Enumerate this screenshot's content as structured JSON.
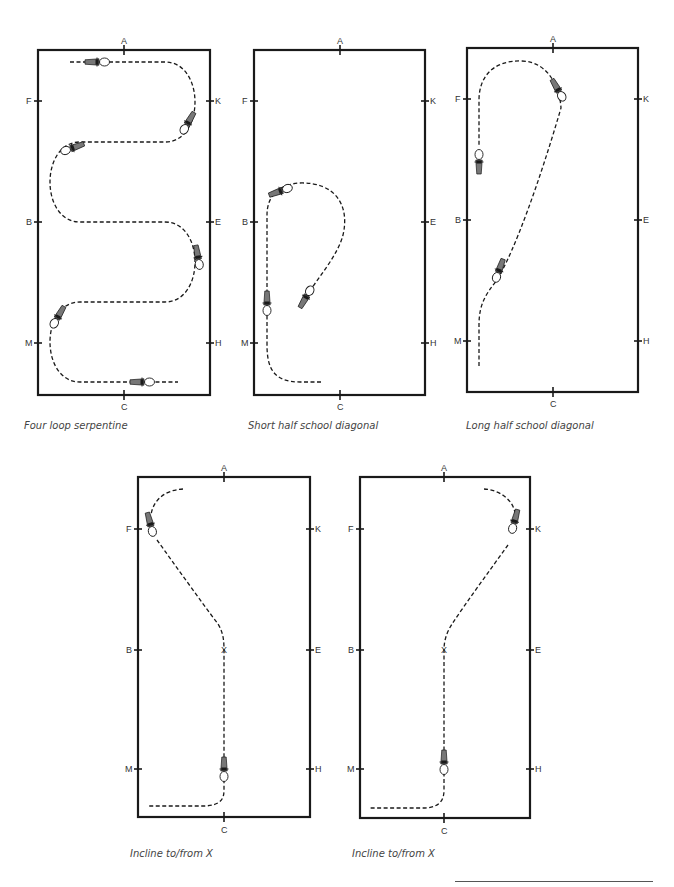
{
  "diagrams": [
    {
      "id": "four-loop-serpentine",
      "caption": "Four loop serpentine",
      "markers": {
        "top": "A",
        "bottom": "C",
        "left": [
          "F",
          "B",
          "M"
        ],
        "right": [
          "K",
          "E",
          "H"
        ]
      }
    },
    {
      "id": "short-half-school-diagonal",
      "caption": "Short half school diagonal",
      "markers": {
        "top": "A",
        "bottom": "C",
        "left": [
          "F",
          "B",
          "M"
        ],
        "right": [
          "K",
          "E",
          "H"
        ]
      }
    },
    {
      "id": "long-half-school-diagonal",
      "caption": "Long half school diagonal",
      "markers": {
        "top": "A",
        "bottom": "C",
        "left": [
          "F",
          "B",
          "M"
        ],
        "right": [
          "K",
          "E",
          "H"
        ]
      }
    },
    {
      "id": "incline-to-from-x-left",
      "caption": "Incline to/from X",
      "markers": {
        "top": "A",
        "bottom": "C",
        "center": "X",
        "left": [
          "F",
          "B",
          "M"
        ],
        "right": [
          "K",
          "E",
          "H"
        ]
      }
    },
    {
      "id": "incline-to-from-x-right",
      "caption": "Incline to/from X",
      "markers": {
        "top": "A",
        "bottom": "C",
        "center": "X",
        "left": [
          "F",
          "B",
          "M"
        ],
        "right": [
          "K",
          "E",
          "H"
        ]
      }
    }
  ],
  "icons": {
    "horse": "horse-topview-icon"
  }
}
